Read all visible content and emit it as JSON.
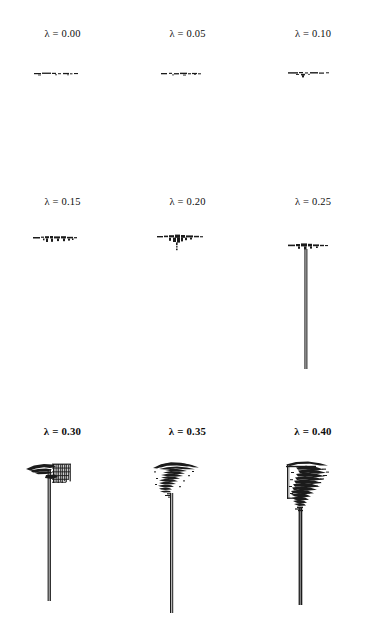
{
  "figure": {
    "background_color": "#ffffff",
    "ink_color": "#111111",
    "grid": {
      "rows": 3,
      "columns": 3
    },
    "symbol": "λ",
    "panels": [
      {
        "id": "panel-lambda-000",
        "label": "λ = 0.00",
        "lambda": 0.0,
        "label_bold": false,
        "growth_stage": "flat-seed-layer",
        "has_stem": false,
        "stem_length_px": 0,
        "crown_width_px": 40,
        "crown_height_px": 4,
        "density": "sparse-dashes"
      },
      {
        "id": "panel-lambda-005",
        "label": "λ = 0.05",
        "lambda": 0.05,
        "label_bold": false,
        "growth_stage": "flat-seed-layer",
        "has_stem": false,
        "stem_length_px": 0,
        "crown_width_px": 38,
        "crown_height_px": 4,
        "density": "sparse-dashes"
      },
      {
        "id": "panel-lambda-010",
        "label": "λ = 0.10",
        "lambda": 0.1,
        "label_bold": false,
        "growth_stage": "flat-seed-layer-with-nub",
        "has_stem": false,
        "stem_length_px": 0,
        "crown_width_px": 38,
        "crown_height_px": 6,
        "density": "sparse-dashes"
      },
      {
        "id": "panel-lambda-015",
        "label": "λ = 0.15",
        "lambda": 0.15,
        "label_bold": false,
        "growth_stage": "thickening-seed-layer",
        "has_stem": false,
        "stem_length_px": 0,
        "crown_width_px": 38,
        "crown_height_px": 8,
        "density": "moderate"
      },
      {
        "id": "panel-lambda-020",
        "label": "λ = 0.20",
        "lambda": 0.2,
        "label_bold": false,
        "growth_stage": "seed-layer-with-incipient-stem",
        "has_stem": false,
        "stem_length_px": 0,
        "crown_width_px": 40,
        "crown_height_px": 10,
        "density": "moderate"
      },
      {
        "id": "panel-lambda-025",
        "label": "λ = 0.25",
        "lambda": 0.25,
        "label_bold": false,
        "growth_stage": "long-thin-stem",
        "has_stem": true,
        "stem_length_px": 120,
        "crown_width_px": 42,
        "crown_height_px": 7,
        "density": "moderate"
      },
      {
        "id": "panel-lambda-030",
        "label": "λ = 0.30",
        "lambda": 0.3,
        "label_bold": true,
        "growth_stage": "stem-with-striated-crown",
        "has_stem": true,
        "stem_length_px": 132,
        "crown_width_px": 44,
        "crown_height_px": 32,
        "density": "dense-striated"
      },
      {
        "id": "panel-lambda-035",
        "label": "λ = 0.35",
        "lambda": 0.35,
        "label_bold": true,
        "growth_stage": "stem-with-branched-crown",
        "has_stem": true,
        "stem_length_px": 120,
        "crown_width_px": 56,
        "crown_height_px": 48,
        "density": "dense-branched"
      },
      {
        "id": "panel-lambda-040",
        "label": "λ = 0.40",
        "lambda": 0.4,
        "label_bold": true,
        "growth_stage": "thick-stem-with-large-dendritic-crown",
        "has_stem": true,
        "stem_length_px": 98,
        "crown_width_px": 62,
        "crown_height_px": 78,
        "density": "very-dense-dendritic"
      }
    ]
  }
}
